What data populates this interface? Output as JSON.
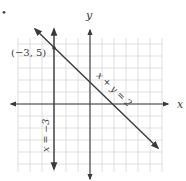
{
  "figure": {
    "bullet": "•",
    "axes": {
      "x_label": "x",
      "y_label": "y",
      "x_range": [
        -6,
        6
      ],
      "y_range": [
        -5.5,
        5.5
      ],
      "grid": true
    },
    "lines": [
      {
        "equation": "x + y = 2",
        "label": "x + y = 2"
      },
      {
        "equation": "x = −3",
        "label": "x = −3"
      }
    ],
    "points": [
      {
        "label": "(−3, 5)",
        "x": -3,
        "y": 5
      }
    ],
    "colors": {
      "line": "#3a3a3a",
      "grid": "#d4d4d4",
      "text": "#3a3a3a"
    }
  }
}
